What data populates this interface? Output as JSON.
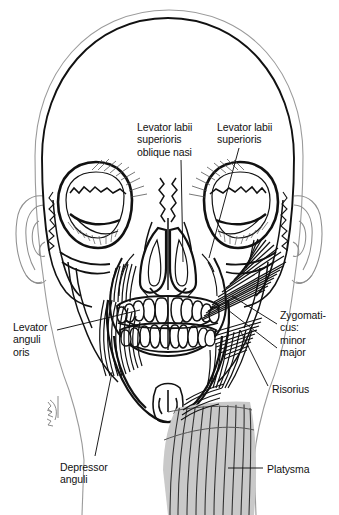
{
  "figure": {
    "view": "anterior",
    "background_color": "#ffffff",
    "ink_color": "#111111",
    "soft_tissue_color": "#9b9b9b",
    "platysma_fill": "#c9c9c9"
  },
  "labels": [
    {
      "id": "levator-labii-superioris-oblique-nasi",
      "text": "Levator labii\nsuperioris\noblique nasi",
      "lines": [
        "Levator labii",
        "superioris",
        "oblique nasi"
      ],
      "x": 137,
      "y": 121,
      "leader": {
        "x1": 181,
        "y1": 160,
        "x2": 183,
        "y2": 262
      }
    },
    {
      "id": "levator-labii-superioris",
      "text": "Levator labii\nsuperioris",
      "lines": [
        "Levator labii",
        "superioris"
      ],
      "x": 217,
      "y": 121,
      "leader": {
        "x1": 239,
        "y1": 148,
        "x2": 209,
        "y2": 258
      }
    },
    {
      "id": "zygomaticus",
      "text": "Zygomati-\ncus:\nminor\nmajor",
      "lines": [
        "Zygomati-",
        "cus:",
        "minor",
        "major"
      ],
      "x": 280,
      "y": 309,
      "leader_minor": {
        "x1": 277,
        "y1": 324,
        "x2": 232,
        "y2": 296
      },
      "leader_major": {
        "x1": 277,
        "y1": 348,
        "x2": 228,
        "y2": 310
      }
    },
    {
      "id": "risorius",
      "text": "Risorius",
      "lines": [
        "Risorius"
      ],
      "x": 272,
      "y": 383,
      "leader": {
        "x1": 268,
        "y1": 386,
        "x2": 240,
        "y2": 330
      }
    },
    {
      "id": "platysma",
      "text": "Platysma",
      "lines": [
        "Platysma"
      ],
      "x": 267,
      "y": 463,
      "leader": {
        "x1": 263,
        "y1": 468,
        "x2": 228,
        "y2": 468
      }
    },
    {
      "id": "levator-anguli-oris",
      "text": "Levator\nanguli\noris",
      "lines": [
        "Levator",
        "anguli",
        "oris"
      ],
      "x": 13,
      "y": 321,
      "leader": {
        "x1": 57,
        "y1": 330,
        "x2": 140,
        "y2": 310
      }
    },
    {
      "id": "depressor-anguli",
      "text": "Depressor\nanguli",
      "lines": [
        "Depressor",
        "anguli"
      ],
      "x": 60,
      "y": 461,
      "leader": {
        "x1": 95,
        "y1": 456,
        "x2": 112,
        "y2": 372
      }
    }
  ],
  "structures": [
    {
      "id": "cranium",
      "name": "cranial vault"
    },
    {
      "id": "soft-tissue-outline",
      "name": "soft tissue head outline"
    },
    {
      "id": "orbit-left",
      "name": "left orbit"
    },
    {
      "id": "orbit-right",
      "name": "right orbit"
    },
    {
      "id": "orbicularis-oculi",
      "name": "orbicularis oculi fibers"
    },
    {
      "id": "nasal-aperture",
      "name": "piriform nasal aperture"
    },
    {
      "id": "maxilla",
      "name": "maxilla"
    },
    {
      "id": "mandible",
      "name": "mandible"
    },
    {
      "id": "teeth-upper",
      "name": "upper dental arch"
    },
    {
      "id": "teeth-lower",
      "name": "lower dental arch"
    },
    {
      "id": "ear-left",
      "name": "left auricle"
    },
    {
      "id": "ear-right",
      "name": "right auricle"
    },
    {
      "id": "mental-protuberance",
      "name": "mental protuberance"
    },
    {
      "id": "artist-signature",
      "name": "artist signature"
    }
  ],
  "teeth": {
    "upper_count": 12,
    "lower_count": 12
  }
}
